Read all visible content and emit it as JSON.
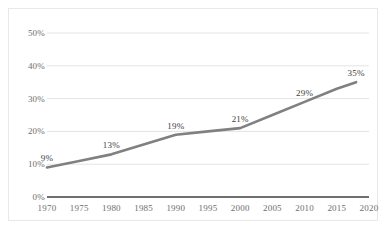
{
  "chart_data": {
    "type": "line",
    "title": "",
    "subtitle": "",
    "xlabel": "",
    "ylabel": "",
    "x": [
      1970,
      1975,
      1980,
      1985,
      1990,
      1995,
      2000,
      2005,
      2010,
      2015,
      2018
    ],
    "xtick_labels": [
      "1970",
      "1975",
      "1980",
      "1985",
      "1990",
      "1995",
      "2000",
      "2005",
      "2010",
      "2015",
      "2020"
    ],
    "xticks": [
      1970,
      1975,
      1980,
      1985,
      1990,
      1995,
      2000,
      2005,
      2010,
      2015,
      2020
    ],
    "xlim": [
      1970,
      2020
    ],
    "ytick_labels": [
      "0%",
      "10%",
      "20%",
      "30%",
      "40%",
      "50%"
    ],
    "yticks": [
      0,
      10,
      20,
      30,
      40,
      50
    ],
    "ylim": [
      0,
      50
    ],
    "grid": true,
    "grid_axis": "y",
    "legend": false,
    "legend_position": "none",
    "series": [
      {
        "name": "",
        "color": "#808080",
        "values": [
          9,
          11,
          13,
          16,
          19,
          20,
          21,
          25,
          29,
          33,
          35
        ]
      }
    ],
    "point_labels": [
      {
        "x": 1970,
        "y": 9,
        "text": "9%"
      },
      {
        "x": 1980,
        "y": 13,
        "text": "13%"
      },
      {
        "x": 1990,
        "y": 19,
        "text": "19%"
      },
      {
        "x": 2000,
        "y": 21,
        "text": "21%"
      },
      {
        "x": 2010,
        "y": 29,
        "text": "29%"
      },
      {
        "x": 2018,
        "y": 35,
        "text": "35%"
      }
    ],
    "colors": {
      "line": "#808080",
      "grid": "#e4e4e4",
      "axis": "#3f3f3f",
      "tick_text": "#6e6e6e",
      "label_text": "#3d3d3d",
      "border": "#e8e8e8",
      "background": "#ffffff"
    }
  }
}
